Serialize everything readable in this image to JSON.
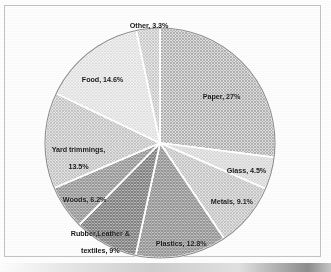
{
  "chart_data": {
    "type": "pie",
    "title": "",
    "subtitle": "",
    "xlabel": "",
    "ylabel": "",
    "legend_position": "none",
    "grid": false,
    "labels_inside": true,
    "start_angle_deg": 0,
    "direction": "clockwise",
    "categories": [
      "Paper",
      "Glass",
      "Metals",
      "Plastics",
      "Rubber,Leather & textiles",
      "Woods",
      "Yard trimmings",
      "Food",
      "Other"
    ],
    "values": [
      27,
      4.5,
      9.1,
      12.8,
      9,
      6.2,
      13.5,
      14.6,
      3.3
    ],
    "slices": [
      {
        "name": "Paper",
        "value": 27,
        "label_line1": "Paper, 27%",
        "label_line2": "",
        "fill": "#b2b2b2",
        "pattern": "fine-crosshatch",
        "label_x": 195,
        "label_y": 85
      },
      {
        "name": "Glass",
        "value": 4.5,
        "label_line1": "Glass, 4.5%",
        "label_line2": "",
        "fill": "#cfcfcf",
        "pattern": "fine-crosshatch",
        "label_x": 219,
        "label_y": 159
      },
      {
        "name": "Metals",
        "value": 9.1,
        "label_line1": "Metals, 9.1%",
        "label_line2": "",
        "fill": "#bdbdbd",
        "pattern": "fine-crosshatch",
        "label_x": 203,
        "label_y": 190
      },
      {
        "name": "Plastics",
        "value": 12.8,
        "label_line1": "Plastics, 12.8%",
        "label_line2": "",
        "fill": "#9a9a9a",
        "pattern": "fine-crosshatch",
        "label_x": 148,
        "label_y": 232
      },
      {
        "name": "Rubber,Leather & textiles",
        "value": 9,
        "label_line1": "Rubber,Leather &",
        "label_line2": "textiles, 9%",
        "fill": "#8e8e8e",
        "pattern": "fine-crosshatch",
        "label_x": 63,
        "label_y": 222
      },
      {
        "name": "Woods",
        "value": 6.2,
        "label_line1": "Woods, 6.2%",
        "label_line2": "",
        "fill": "#a2a2a2",
        "pattern": "fine-crosshatch",
        "label_x": 55,
        "label_y": 188
      },
      {
        "name": "Yard trimmings",
        "value": 13.5,
        "label_line1": "Yard trimmings,",
        "label_line2": "13.5%",
        "fill": "#bcbcbc",
        "pattern": "fine-crosshatch",
        "label_x": 44,
        "label_y": 138
      },
      {
        "name": "Food",
        "value": 14.6,
        "label_line1": "Food, 14.6%",
        "label_line2": "",
        "fill": "#e2e2e2",
        "pattern": "fine-crosshatch",
        "label_x": 74,
        "label_y": 68
      },
      {
        "name": "Other",
        "value": 3.3,
        "label_line1": "Other, 3.3%",
        "label_line2": "",
        "fill": "#c8c8c8",
        "pattern": "fine-crosshatch",
        "label_x": 122,
        "label_y": 14
      }
    ],
    "geometry": {
      "center_x": 160,
      "center_y": 143,
      "radius": 115
    },
    "colors": {
      "slice_border": "#ffffff",
      "pie_outline": "#8d8d8d",
      "frame": "#c3c3c3",
      "background": "#fdfdfd",
      "label_text": "#18181a"
    }
  }
}
